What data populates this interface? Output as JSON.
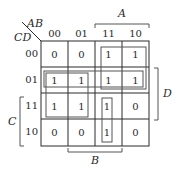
{
  "kmap": {
    "row_var_label": "CD",
    "col_var_label": "AB",
    "col_headers": [
      "00",
      "01",
      "11",
      "10"
    ],
    "row_headers": [
      "00",
      "01",
      "11",
      "10"
    ],
    "cells": [
      [
        "0",
        "0",
        "1",
        "1"
      ],
      [
        "1",
        "1",
        "1",
        "1"
      ],
      [
        "1",
        "1",
        "1",
        "0"
      ],
      [
        "0",
        "0",
        "1",
        "0"
      ]
    ],
    "brackets": {
      "A": "A",
      "B": "B",
      "C": "C",
      "D": "D"
    },
    "groups": [
      {
        "name": "A-Cbar",
        "rows": [
          "00",
          "01"
        ],
        "cols": [
          "11",
          "10"
        ]
      },
      {
        "name": "Cbar-D",
        "rows": [
          "01"
        ],
        "cols": [
          "00",
          "01",
          "11",
          "10"
        ]
      },
      {
        "name": "Abar-D",
        "rows": [
          "01",
          "11"
        ],
        "cols": [
          "00",
          "01"
        ]
      },
      {
        "name": "A-B-C",
        "rows": [
          "11",
          "10"
        ],
        "cols": [
          "11"
        ]
      }
    ],
    "colors": {
      "grid": "#2a2a2a",
      "group": "#555555",
      "bracket": "#555555"
    }
  }
}
